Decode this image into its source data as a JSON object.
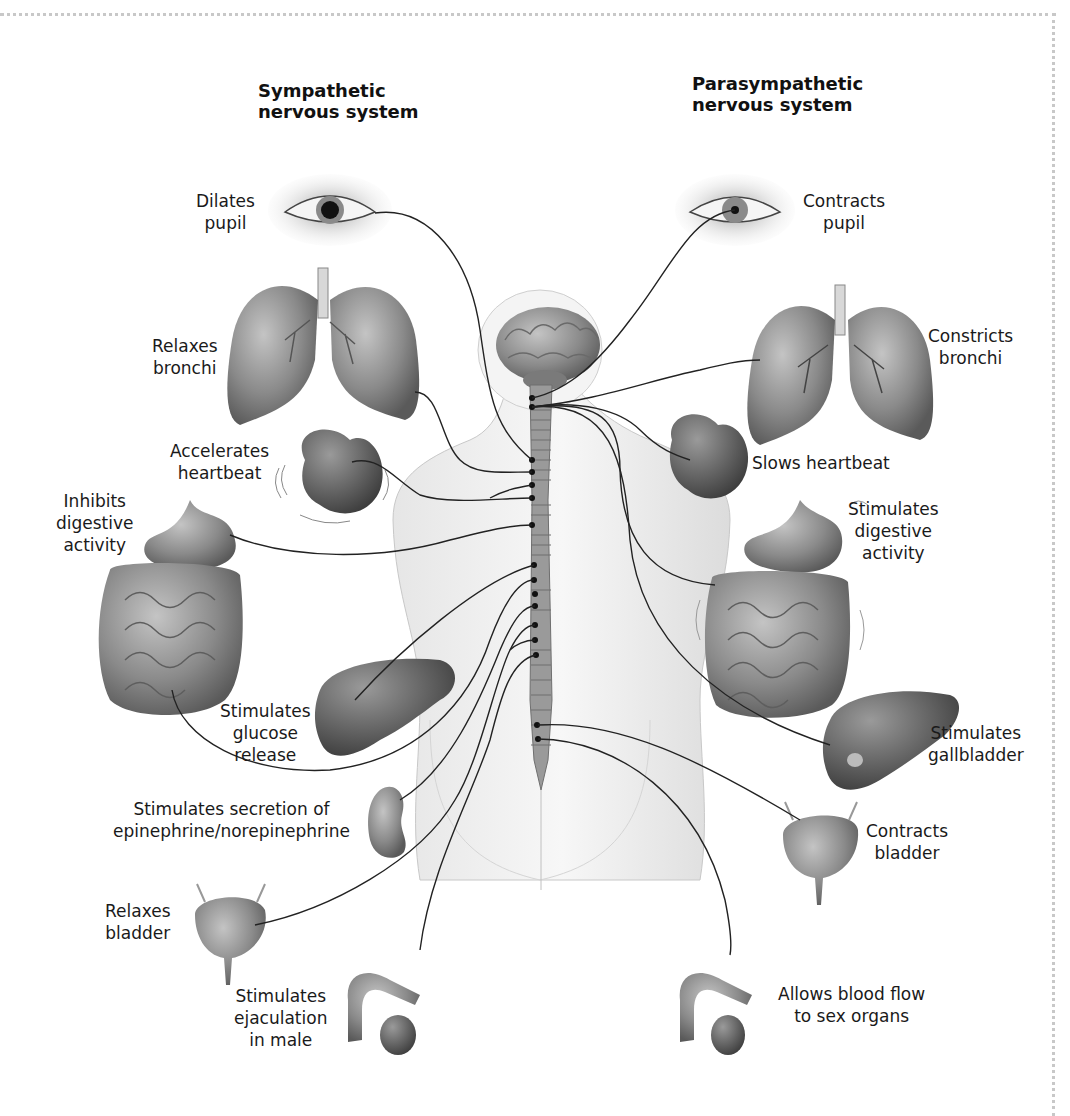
{
  "headings": {
    "sympathetic": [
      "Sympathetic",
      "nervous system"
    ],
    "parasympathetic": [
      "Parasympathetic",
      "nervous system"
    ]
  },
  "sympathetic_effects": [
    {
      "organ": "eye",
      "lines": [
        "Dilates",
        "pupil"
      ]
    },
    {
      "organ": "lungs",
      "lines": [
        "Relaxes",
        "bronchi"
      ]
    },
    {
      "organ": "heart",
      "lines": [
        "Accelerates",
        "heartbeat"
      ]
    },
    {
      "organ": "stomach-intestines",
      "lines": [
        "Inhibits",
        "digestive",
        "activity"
      ]
    },
    {
      "organ": "liver",
      "lines": [
        "Stimulates",
        "glucose",
        "release"
      ]
    },
    {
      "organ": "adrenal-kidney",
      "lines": [
        "Stimulates secretion of",
        "epinephrine/norepinephrine"
      ]
    },
    {
      "organ": "bladder",
      "lines": [
        "Relaxes",
        "bladder"
      ]
    },
    {
      "organ": "male-reproductive",
      "lines": [
        "Stimulates",
        "ejaculation",
        "in male"
      ]
    }
  ],
  "parasympathetic_effects": [
    {
      "organ": "eye",
      "lines": [
        "Contracts",
        "pupil"
      ]
    },
    {
      "organ": "lungs",
      "lines": [
        "Constricts",
        "bronchi"
      ]
    },
    {
      "organ": "heart",
      "lines": [
        "Slows heartbeat"
      ]
    },
    {
      "organ": "stomach-intestines",
      "lines": [
        "Stimulates",
        "digestive",
        "activity"
      ]
    },
    {
      "organ": "liver-gallbladder",
      "lines": [
        "Stimulates",
        "gallbladder"
      ]
    },
    {
      "organ": "bladder",
      "lines": [
        "Contracts",
        "bladder"
      ]
    },
    {
      "organ": "male-reproductive",
      "lines": [
        "Allows blood flow",
        "to sex organs"
      ]
    }
  ],
  "colors": {
    "organ_fill": "#8a8a8a",
    "organ_dark": "#5e5e5e",
    "body_fill": "#f1f1f1",
    "spine_fill": "#9a9a9a",
    "nerve_line": "#222222",
    "frame_dots": "#c8c8c8"
  }
}
